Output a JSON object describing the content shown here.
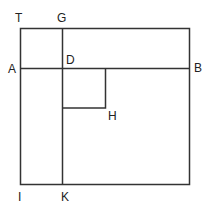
{
  "diagram": {
    "labels": {
      "T": "T",
      "G": "G",
      "A": "A",
      "D": "D",
      "B": "B",
      "H": "H",
      "I": "I",
      "K": "K"
    },
    "line_color": "#333333"
  }
}
